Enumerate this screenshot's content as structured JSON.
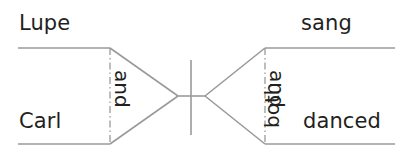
{
  "diagram": {
    "type": "reed-kellogg-sentence-diagram",
    "sentence": "Lupe and Carl both sang and danced",
    "colors": {
      "background": "#ffffff",
      "line": "#9a9a9a",
      "text": "#231f20"
    },
    "subject_branch": {
      "upper_word": "Lupe",
      "lower_word": "Carl",
      "conjunction": "and"
    },
    "predicate_branch": {
      "upper_word": "sang",
      "lower_word": "danced",
      "conjunction": "and",
      "modifier": "both"
    }
  },
  "geometry": {
    "upper_baseline_y": 48,
    "lower_baseline_y": 144,
    "left_line_start_x": 18,
    "left_fork_x": 110,
    "right_fork_x": 265,
    "right_line_end_x": 395,
    "apex_left_x": 178,
    "apex_right_x": 205,
    "apex_y": 96,
    "divider_x": 191,
    "divider_top_y": 60,
    "divider_bottom_y": 135
  }
}
